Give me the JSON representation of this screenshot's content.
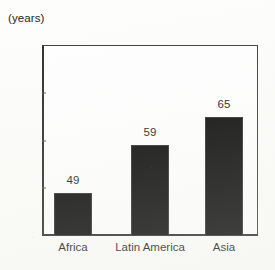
{
  "chart_data": {
    "type": "bar",
    "title": "",
    "subtitle": "",
    "unit_label": "(years)",
    "xlabel": "",
    "ylabel": "",
    "ylim": [
      40,
      80
    ],
    "yticks": [
      40,
      50,
      60,
      70,
      80
    ],
    "ytick_labels": [
      "40",
      "50",
      "60",
      "70",
      "80"
    ],
    "grid": false,
    "legend": false,
    "bar_color": "#080808",
    "categories": [
      "Africa",
      "Latin America",
      "Asia"
    ],
    "values": [
      49,
      59,
      65
    ],
    "value_labels": [
      "49",
      "59",
      "65"
    ]
  }
}
